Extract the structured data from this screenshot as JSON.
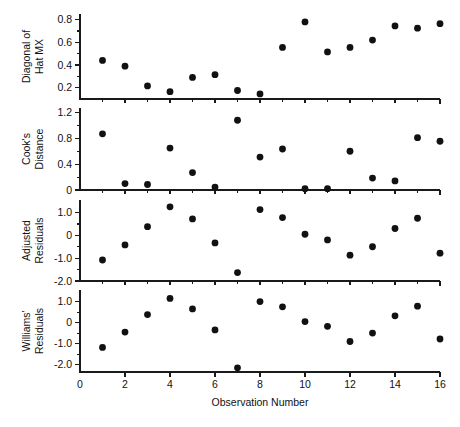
{
  "figure": {
    "title": "",
    "background_color": "#ffffff",
    "marker_color": "#111111",
    "axis_color": "#1a1a1a",
    "xlabel": "Observation Number"
  },
  "chart_data": [
    {
      "type": "scatter",
      "panel_index": 0,
      "title": "",
      "xlabel": "",
      "ylabel": "Diagonal of Hat MX",
      "ylabel_lines": [
        "Diagonal of",
        "Hat MX"
      ],
      "x": [
        1,
        2,
        3,
        4,
        5,
        6,
        7,
        8,
        9,
        10,
        11,
        12,
        13,
        14,
        15,
        16
      ],
      "values": [
        0.44,
        0.39,
        0.215,
        0.165,
        0.29,
        0.315,
        0.175,
        0.145,
        0.555,
        0.78,
        0.515,
        0.555,
        0.62,
        0.745,
        0.725,
        0.765
      ],
      "xlim": [
        0,
        16
      ],
      "ylim": [
        0.1,
        0.85
      ],
      "ytick_values": [
        0.2,
        0.4,
        0.6,
        0.8
      ],
      "ytick_labels": [
        "0.2",
        "0.4",
        "0.6",
        "0.8"
      ],
      "yminor_values": [
        0.3,
        0.5,
        0.7
      ],
      "grid": false,
      "legend": false
    },
    {
      "type": "scatter",
      "panel_index": 1,
      "title": "",
      "xlabel": "",
      "ylabel": "Cook's Distance",
      "ylabel_lines": [
        "Cook's",
        "Distance"
      ],
      "x": [
        1,
        2,
        3,
        4,
        5,
        6,
        7,
        8,
        9,
        10,
        11,
        12,
        13,
        14,
        15,
        16
      ],
      "values": [
        0.87,
        0.1,
        0.085,
        0.65,
        0.27,
        0.045,
        1.08,
        0.51,
        0.635,
        0.02,
        0.02,
        0.6,
        0.185,
        0.14,
        0.81,
        0.755
      ],
      "xlim": [
        0,
        16
      ],
      "ylim": [
        0,
        1.27
      ],
      "ytick_values": [
        0,
        0.4,
        0.8,
        1.2
      ],
      "ytick_labels": [
        "0",
        "0.4",
        "0.8",
        "1.2"
      ],
      "yminor_values": [
        0.2,
        0.6,
        1.0
      ],
      "grid": false,
      "legend": false
    },
    {
      "type": "scatter",
      "panel_index": 2,
      "title": "",
      "xlabel": "",
      "ylabel": "Adjusted Residuals",
      "ylabel_lines": [
        "Adjusted",
        "Residuals"
      ],
      "x": [
        1,
        2,
        3,
        4,
        5,
        6,
        7,
        8,
        9,
        10,
        11,
        12,
        13,
        14,
        15,
        16
      ],
      "values": [
        -1.08,
        -0.42,
        0.38,
        1.25,
        0.72,
        -0.33,
        -1.63,
        1.13,
        0.78,
        0.05,
        -0.2,
        -0.87,
        -0.5,
        0.3,
        0.75,
        -0.78
      ],
      "xlim": [
        0,
        16
      ],
      "ylim": [
        -2.0,
        1.55
      ],
      "ytick_values": [
        -2.0,
        -1.0,
        0,
        1.0
      ],
      "ytick_labels": [
        "-2.0",
        "-1.0",
        "0",
        "1.0"
      ],
      "yminor_values": [
        -1.5,
        -0.5,
        0.5
      ],
      "grid": false,
      "legend": false
    },
    {
      "type": "scatter",
      "panel_index": 3,
      "title": "",
      "xlabel": "Observation Number",
      "ylabel": "Williams' Residuals",
      "ylabel_lines": [
        "Williams'",
        "Residuals"
      ],
      "x": [
        1,
        2,
        3,
        4,
        5,
        6,
        7,
        8,
        9,
        10,
        11,
        12,
        13,
        14,
        15,
        16
      ],
      "values": [
        -1.18,
        -0.45,
        0.38,
        1.15,
        0.65,
        -0.35,
        -2.15,
        1.0,
        0.75,
        0.05,
        -0.18,
        -0.9,
        -0.5,
        0.32,
        0.78,
        -0.78
      ],
      "xlim": [
        0,
        16
      ],
      "ylim": [
        -2.35,
        1.55
      ],
      "ytick_values": [
        -2.0,
        -1.0,
        0,
        1.0
      ],
      "ytick_labels": [
        "-2.0",
        "-1.0",
        "0",
        "1.0"
      ],
      "yminor_values": [
        -1.5,
        -0.5,
        0.5
      ],
      "xtick_values": [
        0,
        2,
        4,
        6,
        8,
        10,
        12,
        14,
        16
      ],
      "xtick_labels": [
        "0",
        "2",
        "4",
        "6",
        "8",
        "10",
        "12",
        "14",
        "16"
      ],
      "xminor_values": [
        1,
        3,
        5,
        7,
        9,
        11,
        13,
        15
      ],
      "grid": false,
      "legend": false
    }
  ]
}
